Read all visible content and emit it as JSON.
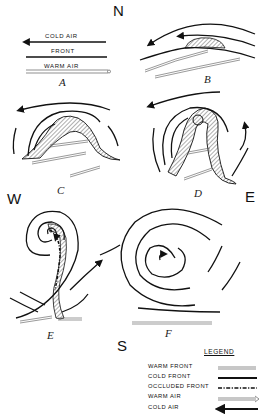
{
  "figure": {
    "compass": {
      "north": "N",
      "south": "S",
      "east": "E",
      "west": "W"
    },
    "panel_a_text": {
      "cold_air": "COLD  AIR",
      "front": "FRONT",
      "warm_air": "WARM  AIR"
    },
    "panels": [
      {
        "id": "A",
        "label": "A"
      },
      {
        "id": "B",
        "label": "B"
      },
      {
        "id": "C",
        "label": "C"
      },
      {
        "id": "D",
        "label": "D"
      },
      {
        "id": "E",
        "label": "E"
      },
      {
        "id": "F",
        "label": "F"
      }
    ],
    "legend": {
      "title": "LEGEND",
      "items": [
        {
          "label": "WARM  FRONT",
          "symbol": "double-line"
        },
        {
          "label": "COLD  FRONT",
          "symbol": "thick-line"
        },
        {
          "label": "OCCLUDED FRONT",
          "symbol": "dash-dot-line"
        },
        {
          "label": "WARM  AIR",
          "symbol": "hollow-arrow"
        },
        {
          "label": "COLD  AIR",
          "symbol": "solid-arrow-left"
        }
      ]
    }
  }
}
